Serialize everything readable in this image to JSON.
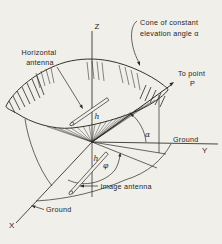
{
  "background": "#f1efe9",
  "ink": "#2a2823",
  "labels": {
    "z_axis": "Z",
    "x_axis": "X",
    "y_axis": "Y",
    "cone_callout_line1": "Cone of constant",
    "cone_callout_line2": "elevation angle α",
    "horizontal_antenna_line1": "Horizontal",
    "horizontal_antenna_line2": "antenna",
    "to_point_line1": "To point",
    "to_point_line2": "P",
    "ground_right": "Ground",
    "ground_left": "Ground",
    "image_antenna": "Image antenna",
    "elevation_angle": "α",
    "azimuth_angle": "φ",
    "height_above": "h",
    "height_below": "h"
  }
}
